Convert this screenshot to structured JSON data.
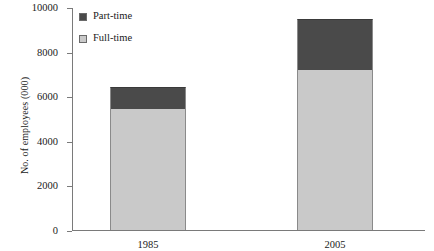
{
  "chart_data": {
    "type": "bar",
    "stacked": true,
    "title": "",
    "xlabel": "",
    "ylabel": "No. of employees (000)",
    "categories": [
      "1985",
      "2005"
    ],
    "series": [
      {
        "name": "Full-time",
        "values": [
          5430,
          7175
        ],
        "color": "#c9c9c9"
      },
      {
        "name": "Part-time",
        "values": [
          970,
          2285
        ],
        "color": "#4a4a4a"
      }
    ],
    "totals": [
      6400,
      9460
    ],
    "ylim": [
      0,
      10000
    ],
    "yticks": [
      0,
      2000,
      4000,
      6000,
      8000,
      10000
    ],
    "ytick_labels": [
      "0",
      "2000",
      "4000",
      "6000",
      "8000",
      "10000"
    ],
    "grid": false,
    "legend_position": "top-left",
    "legend_order": [
      "Part-time",
      "Full-time"
    ]
  },
  "axis": {
    "y_title": "No. of employees (000)"
  },
  "legend": {
    "entries": [
      {
        "label": "Part-time",
        "color": "#4a4a4a"
      },
      {
        "label": "Full-time",
        "color": "#c9c9c9"
      }
    ]
  }
}
